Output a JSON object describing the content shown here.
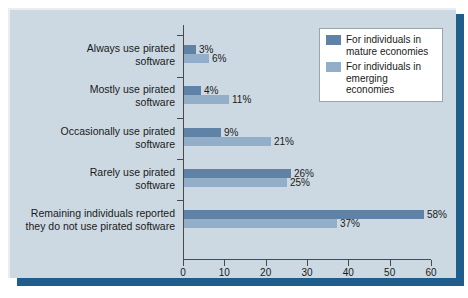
{
  "chart_data": {
    "type": "bar",
    "orientation": "horizontal",
    "title": "",
    "xlabel": "",
    "ylabel": "",
    "xlim": [
      0,
      60
    ],
    "grid": false,
    "legend_position": "top-right",
    "xticks": [
      "0",
      "10",
      "20",
      "30",
      "40",
      "50",
      "60"
    ],
    "xtick_values": [
      0,
      10,
      20,
      30,
      40,
      50,
      60
    ],
    "categories": [
      "Always use pirated software",
      "Mostly use pirated software",
      "Occasionally use pirated software",
      "Rarely use pirated software",
      "Remaining individuals reported they do not use pirated software"
    ],
    "category_lines": [
      [
        "Always use pirated",
        "software"
      ],
      [
        "Mostly use pirated",
        "software"
      ],
      [
        "Occasionally use pirated",
        "software"
      ],
      [
        "Rarely use pirated",
        "software"
      ],
      [
        "Remaining individuals reported",
        "they do not use pirated software"
      ]
    ],
    "series": [
      {
        "name": "For individuals in mature economies",
        "name_lines": [
          "For individuals in",
          "mature economies"
        ],
        "color": "#5f82a6",
        "values": [
          3,
          4,
          9,
          26,
          58
        ],
        "labels": [
          "3%",
          "4%",
          "9%",
          "26%",
          "58%"
        ]
      },
      {
        "name": "For individuals in emerging economies",
        "name_lines": [
          "For individuals in",
          "emerging economies"
        ],
        "color": "#92aec8",
        "values": [
          6,
          11,
          21,
          25,
          37
        ],
        "labels": [
          "6%",
          "11%",
          "21%",
          "25%",
          "37%"
        ]
      }
    ]
  },
  "colors": {
    "panel_background": "#ccd9e3",
    "shadow": "#1f5d8c",
    "axis": "#4a4a4a",
    "mature": "#5f82a6",
    "emerging": "#92aec8",
    "legend_background": "#ffffff",
    "legend_border": "#9aa4ab"
  }
}
